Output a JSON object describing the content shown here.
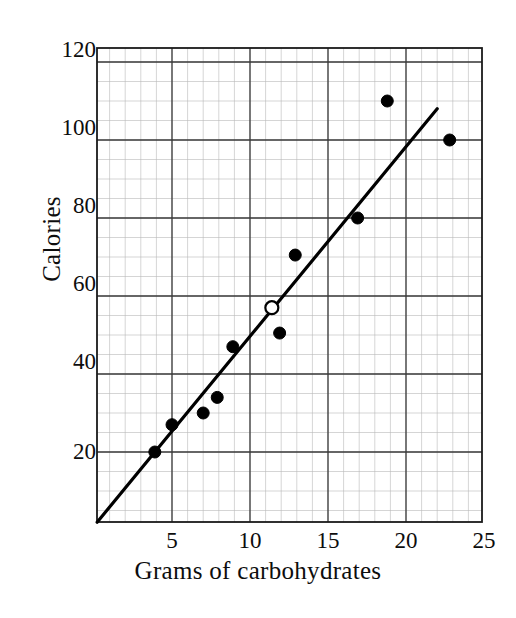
{
  "chart_data": {
    "type": "scatter",
    "title": "",
    "xlabel": "Grams of carbohydrates",
    "ylabel": "Calories",
    "xlim": [
      0,
      25
    ],
    "ylim": [
      0,
      120
    ],
    "xticks": [
      5,
      10,
      15,
      20,
      25
    ],
    "yticks": [
      20,
      40,
      60,
      80,
      100,
      120
    ],
    "xticklabels": [
      "5",
      "10",
      "15",
      "20",
      "25"
    ],
    "yticklabels": [
      "20",
      "40",
      "60",
      "80",
      "100",
      "120"
    ],
    "grid": "major-and-minor",
    "grid_minor_spacing_x": 1,
    "grid_minor_spacing_y": 5,
    "legend": "none",
    "series": [
      {
        "name": "Data points",
        "marker": "filled-circle",
        "color": "#000000",
        "points": [
          {
            "x": 3.9,
            "y": 20
          },
          {
            "x": 5.0,
            "y": 27
          },
          {
            "x": 7.0,
            "y": 30
          },
          {
            "x": 7.9,
            "y": 34
          },
          {
            "x": 8.9,
            "y": 47
          },
          {
            "x": 11.9,
            "y": 50.5
          },
          {
            "x": 12.9,
            "y": 70.5
          },
          {
            "x": 16.9,
            "y": 80
          },
          {
            "x": 18.8,
            "y": 110
          },
          {
            "x": 22.8,
            "y": 100
          }
        ]
      },
      {
        "name": "Highlighted point",
        "marker": "open-circle",
        "color": "#000000",
        "points": [
          {
            "x": 11.4,
            "y": 57
          }
        ]
      },
      {
        "name": "Trend line",
        "marker": "line",
        "color": "#000000",
        "points": [
          {
            "x": 0.2,
            "y": 2
          },
          {
            "x": 22.0,
            "y": 108
          }
        ]
      }
    ]
  },
  "axes": {
    "x_axis_name": "x-axis",
    "y_axis_name": "y-axis"
  }
}
